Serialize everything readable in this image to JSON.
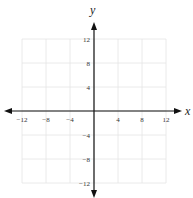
{
  "chart_data": {
    "type": "scatter",
    "title": "",
    "xlabel": "x",
    "ylabel": "y",
    "xlim": [
      -12,
      12
    ],
    "ylim": [
      -12,
      12
    ],
    "grid": true,
    "grid_step": 4,
    "x_ticks": [
      -12,
      -8,
      -4,
      4,
      8,
      12
    ],
    "y_ticks": [
      12,
      8,
      4,
      -4,
      -8,
      -12
    ],
    "x_tick_labels": [
      "−12",
      "−8",
      "−4",
      "4",
      "8",
      "12"
    ],
    "y_tick_labels": [
      "12",
      "8",
      "4",
      "−4",
      "−8",
      "−12"
    ],
    "series": [],
    "legend": null
  },
  "colors": {
    "axis": "#111111",
    "grid": "#e4e4e4",
    "text": "#333333"
  }
}
